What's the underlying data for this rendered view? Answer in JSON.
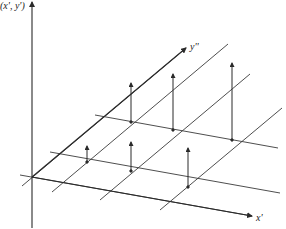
{
  "diagram": {
    "labels": {
      "vertical_axis": "(x', y')",
      "y_axis": "y''",
      "x_axis": "x'"
    },
    "colors": {
      "line": "#2a2a2a",
      "grid": "#3a3a3a",
      "background": "#ffffff"
    },
    "origin": [
      32,
      177
    ],
    "axes": {
      "vertical": {
        "from": [
          32,
          228
        ],
        "to": [
          32,
          2
        ]
      },
      "y": {
        "from": [
          32,
          177
        ],
        "to": [
          186,
          48
        ]
      },
      "x": {
        "from": [
          32,
          177
        ],
        "to": [
          252,
          216
        ]
      }
    },
    "grid_lines_parallel_x": [
      {
        "from": [
          20,
          175
        ],
        "to": [
          252,
          216
        ]
      },
      {
        "from": [
          50,
          152
        ],
        "to": [
          280,
          193
        ]
      },
      {
        "from": [
          95,
          115
        ],
        "to": [
          278,
          148
        ]
      }
    ],
    "grid_lines_parallel_y": [
      {
        "from": [
          22,
          186
        ],
        "to": [
          186,
          48
        ]
      },
      {
        "from": [
          52,
          192
        ],
        "to": [
          228,
          44
        ]
      },
      {
        "from": [
          100,
          200
        ],
        "to": [
          250,
          74
        ]
      },
      {
        "from": [
          160,
          210
        ],
        "to": [
          282,
          108
        ]
      }
    ],
    "impulses": [
      {
        "base": [
          87,
          162
        ],
        "tip": [
          87,
          146
        ]
      },
      {
        "base": [
          131,
          171
        ],
        "tip": [
          131,
          142
        ]
      },
      {
        "base": [
          188,
          187
        ],
        "tip": [
          188,
          148
        ]
      },
      {
        "base": [
          131,
          122
        ],
        "tip": [
          131,
          83
        ]
      },
      {
        "base": [
          173,
          130
        ],
        "tip": [
          173,
          74
        ]
      },
      {
        "base": [
          232,
          140
        ],
        "tip": [
          232,
          63
        ]
      }
    ]
  }
}
